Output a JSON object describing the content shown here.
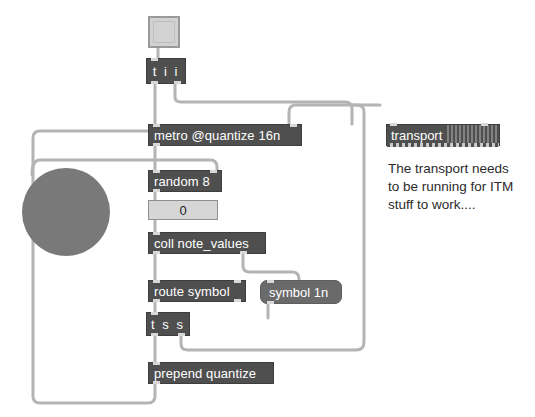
{
  "patcher": {
    "title": "Max patcher",
    "background_color": "#ffffff",
    "object_color": "#4f4f4f",
    "object_text_color": "#ffffff",
    "message_color": "#6a6a6a",
    "cord_color": "#b4b4b4",
    "circle_color": "#797979",
    "numbox_color": "#d6d6d6"
  },
  "objects": {
    "toggle": {
      "name": "toggle",
      "value": ""
    },
    "trigger_top": {
      "text": "t i i"
    },
    "metro": {
      "text": "metro @quantize 16n"
    },
    "transport": {
      "text": "transport"
    },
    "random": {
      "text": "random 8"
    },
    "number_box": {
      "value": "0"
    },
    "coll": {
      "text": "coll note_values"
    },
    "route": {
      "text": "route symbol"
    },
    "symbol_msg": {
      "text": "symbol 1n"
    },
    "trigger_bottom": {
      "text": "t s s"
    },
    "prepend": {
      "text": "prepend quantize"
    },
    "bang_circle": {
      "name": "bang"
    }
  },
  "comment": {
    "text": "The transport needs\nto be running for ITM\nstuff to work...."
  }
}
